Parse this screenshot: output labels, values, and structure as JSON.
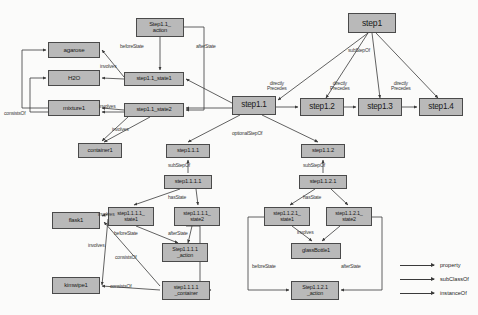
{
  "diagram": {
    "node_fill": "#b9b9b9",
    "node_stroke": "#4a4a4a",
    "edge_color": "#3a3a3a",
    "background": "#fbfbfa",
    "nodes": [
      {
        "id": "agarose",
        "label": "agarose",
        "x": 48,
        "y": 42,
        "w": 52,
        "h": 16,
        "fs": 6.2
      },
      {
        "id": "h2o",
        "label": "H2O",
        "x": 48,
        "y": 70,
        "w": 52,
        "h": 16,
        "fs": 6.2
      },
      {
        "id": "mixture1",
        "label": "mixture1",
        "x": 48,
        "y": 100,
        "w": 52,
        "h": 16,
        "fs": 6.2
      },
      {
        "id": "container1",
        "label": "container1",
        "x": 78,
        "y": 143,
        "w": 44,
        "h": 15,
        "fs": 5.8
      },
      {
        "id": "step1_1_action",
        "label": "Step1.1_\naction",
        "x": 136,
        "y": 18,
        "w": 48,
        "h": 19,
        "fs": 5.8
      },
      {
        "id": "step1_1_state1",
        "label": "step1.1_state1",
        "x": 124,
        "y": 72,
        "w": 60,
        "h": 14,
        "fs": 5.8
      },
      {
        "id": "step1_1_state2",
        "label": "step1.1_state2",
        "x": 124,
        "y": 103,
        "w": 60,
        "h": 14,
        "fs": 5.8
      },
      {
        "id": "step1_1",
        "label": "step1.1",
        "x": 232,
        "y": 96,
        "w": 44,
        "h": 19,
        "fs": 8.2
      },
      {
        "id": "step1",
        "label": "step1",
        "x": 348,
        "y": 13,
        "w": 48,
        "h": 20,
        "fs": 8.6
      },
      {
        "id": "step1_2",
        "label": "step1.2",
        "x": 300,
        "y": 98,
        "w": 44,
        "h": 18,
        "fs": 8.2
      },
      {
        "id": "step1_3",
        "label": "step1.3",
        "x": 358,
        "y": 98,
        "w": 44,
        "h": 18,
        "fs": 8.2
      },
      {
        "id": "step1_4",
        "label": "step1.4",
        "x": 419,
        "y": 98,
        "w": 44,
        "h": 18,
        "fs": 8.2
      },
      {
        "id": "step1_1_1",
        "label": "step1.1.1",
        "x": 166,
        "y": 144,
        "w": 44,
        "h": 14,
        "fs": 5.8
      },
      {
        "id": "step1_1_1_1",
        "label": "step1.1.1.1",
        "x": 164,
        "y": 175,
        "w": 48,
        "h": 14,
        "fs": 5.8
      },
      {
        "id": "step1_1_2",
        "label": "step1.1.2",
        "x": 301,
        "y": 144,
        "w": 44,
        "h": 14,
        "fs": 5.8
      },
      {
        "id": "step1_1_2_1",
        "label": "step1.1.2.1",
        "x": 299,
        "y": 175,
        "w": 48,
        "h": 14,
        "fs": 5.8
      },
      {
        "id": "s1111_state1",
        "label": "step1.1.1.1_\nstate1",
        "x": 108,
        "y": 207,
        "w": 46,
        "h": 19,
        "fs": 5.4
      },
      {
        "id": "s1111_state2",
        "label": "step1.1.1.1_\nstate2",
        "x": 174,
        "y": 207,
        "w": 46,
        "h": 19,
        "fs": 5.4
      },
      {
        "id": "s1111_action",
        "label": "Step1.1.1.1\n_action",
        "x": 162,
        "y": 243,
        "w": 46,
        "h": 19,
        "fs": 5.4
      },
      {
        "id": "s1111_container",
        "label": "step1.1.1.1\n_container",
        "x": 162,
        "y": 281,
        "w": 48,
        "h": 19,
        "fs": 5.4
      },
      {
        "id": "s1121_state1",
        "label": "step1.1.2.1_\nstate1",
        "x": 264,
        "y": 207,
        "w": 46,
        "h": 19,
        "fs": 5.4
      },
      {
        "id": "s1121_state2",
        "label": "step1.1.2.1_\nstate2",
        "x": 326,
        "y": 207,
        "w": 46,
        "h": 19,
        "fs": 5.4
      },
      {
        "id": "glassbottle1",
        "label": "glassBottle1",
        "x": 291,
        "y": 243,
        "w": 50,
        "h": 16,
        "fs": 5.6
      },
      {
        "id": "s1121_action",
        "label": "Step1.1.2.1\n_action",
        "x": 291,
        "y": 281,
        "w": 48,
        "h": 19,
        "fs": 5.4
      },
      {
        "id": "flask1",
        "label": "flask1",
        "x": 52,
        "y": 212,
        "w": 48,
        "h": 17,
        "fs": 6.0
      },
      {
        "id": "kimwipe1",
        "label": "kimwipe1",
        "x": 52,
        "y": 277,
        "w": 48,
        "h": 17,
        "fs": 6.0
      }
    ],
    "edge_labels": [
      {
        "id": "el-consistsof-left",
        "text": "consistsOf",
        "x": 4,
        "y": 111,
        "fs": 5.0
      },
      {
        "id": "el-involves-h2o",
        "text": "involves",
        "x": 100,
        "y": 64,
        "fs": 5.0
      },
      {
        "id": "el-involves-mix",
        "text": "involves",
        "x": 99,
        "y": 104,
        "fs": 5.0
      },
      {
        "id": "el-involves-cont",
        "text": "involves",
        "x": 112,
        "y": 127,
        "fs": 5.0
      },
      {
        "id": "el-beforestate-1",
        "text": "beforeState",
        "x": 120,
        "y": 44,
        "fs": 5.0
      },
      {
        "id": "el-afterstate-1",
        "text": "afterState",
        "x": 196,
        "y": 44,
        "fs": 5.0
      },
      {
        "id": "el-substepof-top",
        "text": "subStepOf",
        "x": 348,
        "y": 48,
        "fs": 5.0
      },
      {
        "id": "el-dp-1",
        "text": "directly\nPrecedes",
        "x": 267,
        "y": 81,
        "fs": 5.0
      },
      {
        "id": "el-dp-2",
        "text": "directly\nPrecedes",
        "x": 330,
        "y": 81,
        "fs": 5.0
      },
      {
        "id": "el-dp-3",
        "text": "directly\nPrecedes",
        "x": 391,
        "y": 81,
        "fs": 5.0
      },
      {
        "id": "el-optionalstepof",
        "text": "optionalStepOf",
        "x": 232,
        "y": 131,
        "fs": 5.0
      },
      {
        "id": "el-substepof-111",
        "text": "subStepOf",
        "x": 168,
        "y": 163,
        "fs": 5.0
      },
      {
        "id": "el-substepof-112",
        "text": "subStepOf",
        "x": 303,
        "y": 163,
        "fs": 5.0
      },
      {
        "id": "el-hasstate-1",
        "text": "hasState",
        "x": 168,
        "y": 195,
        "fs": 5.0
      },
      {
        "id": "el-hasstate-2",
        "text": "hasState",
        "x": 303,
        "y": 195,
        "fs": 5.0
      },
      {
        "id": "el-beforestate-2",
        "text": "beforeState",
        "x": 114,
        "y": 231,
        "fs": 5.0
      },
      {
        "id": "el-afterstate-2",
        "text": "afterState",
        "x": 168,
        "y": 231,
        "fs": 5.0
      },
      {
        "id": "el-involves-glass",
        "text": "involves",
        "x": 297,
        "y": 230,
        "fs": 5.0
      },
      {
        "id": "el-beforestate-3",
        "text": "beforeState",
        "x": 252,
        "y": 264,
        "fs": 5.0
      },
      {
        "id": "el-afterstate-3",
        "text": "afterState",
        "x": 341,
        "y": 264,
        "fs": 5.0
      },
      {
        "id": "el-involves-flask",
        "text": "involves",
        "x": 98,
        "y": 212,
        "fs": 5.0
      },
      {
        "id": "el-involves-kim",
        "text": "involves",
        "x": 88,
        "y": 243,
        "fs": 5.0
      },
      {
        "id": "el-consistsof-1",
        "text": "consistsOf",
        "x": 115,
        "y": 255,
        "fs": 5.0
      },
      {
        "id": "el-consistsof-2",
        "text": "consistsOf",
        "x": 110,
        "y": 284,
        "fs": 5.0
      }
    ],
    "legend": {
      "items": [
        {
          "id": "legend-property",
          "label": "property",
          "y": 262
        },
        {
          "id": "legend-subclassof",
          "label": "subClassOf",
          "y": 276
        },
        {
          "id": "legend-instanceof",
          "label": "instanceOf",
          "y": 290
        }
      ],
      "x": 400,
      "font_size": 5.6
    }
  }
}
